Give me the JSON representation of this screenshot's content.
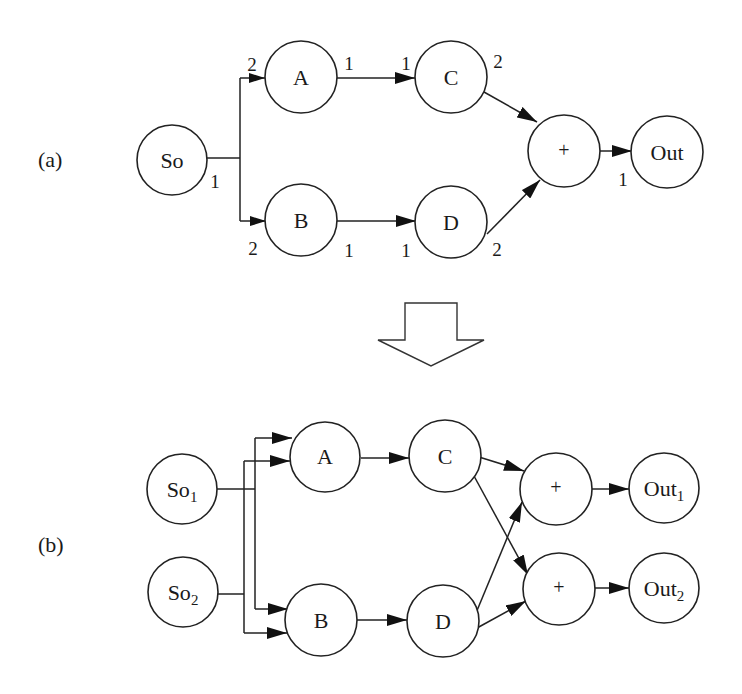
{
  "panels": {
    "a": {
      "label": "(a)",
      "nodes": {
        "so": "So",
        "a": "A",
        "b": "B",
        "c": "C",
        "d": "D",
        "plus": "+",
        "out": "Out"
      },
      "rates": {
        "so_out": "1",
        "a_in": "2",
        "a_out": "1",
        "c_in": "1",
        "c_out": "2",
        "b_in": "2",
        "b_out": "1",
        "d_in": "1",
        "d_out": "2",
        "out_in": "1"
      }
    },
    "b": {
      "label": "(b)",
      "nodes": {
        "so1": "So",
        "so1_sub": "1",
        "so2": "So",
        "so2_sub": "2",
        "a": "A",
        "b": "B",
        "c": "C",
        "d": "D",
        "plus1": "+",
        "plus2": "+",
        "out1": "Out",
        "out1_sub": "1",
        "out2": "Out",
        "out2_sub": "2"
      }
    }
  },
  "transform_arrow": "hollow-down-arrow",
  "colors": {
    "stroke": "#222222",
    "background": "#ffffff"
  }
}
